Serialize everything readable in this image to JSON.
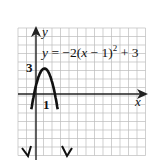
{
  "chart_data": {
    "type": "line",
    "equation": {
      "lhs": "y = ",
      "body": "−2(x − 1)",
      "exp": "2",
      "tail": " + 3"
    },
    "xlabel": "x",
    "ylabel": "y",
    "tick_labels": {
      "x": "1",
      "y": "3"
    },
    "vertex": [
      1,
      3
    ],
    "xlim": [
      -2,
      13
    ],
    "ylim": [
      -7,
      8
    ],
    "grid": true,
    "x": [
      -0.5,
      0,
      0.5,
      1,
      1.5,
      2,
      2.5
    ],
    "values": [
      -1.5,
      1,
      2.5,
      3,
      2.5,
      1,
      -1.5
    ]
  }
}
